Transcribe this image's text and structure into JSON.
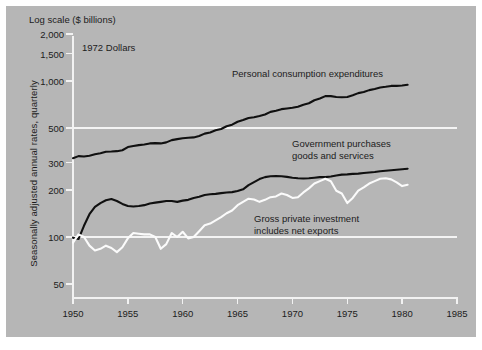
{
  "figure": {
    "background_color": "#b6b6b6",
    "header_label": "Log scale ($ billions)",
    "dollars_note": "1972 Dollars",
    "ylabel": "Seasonally adjusted annual rates, quarterly"
  },
  "chart_data": {
    "type": "line",
    "title": "",
    "subtitle": "1972 Dollars",
    "xlabel": "",
    "ylabel": "Seasonally adjusted annual rates, quarterly",
    "axis_note": "Log scale ($ billions)",
    "yscale": "log",
    "ylim": [
      40,
      2400
    ],
    "xlim": [
      1950,
      1985
    ],
    "yticks": [
      2000,
      1500,
      1000,
      500,
      300,
      200,
      100,
      50
    ],
    "ytick_labels": [
      "2,000",
      "1,500",
      "1,000",
      "500",
      "300",
      "200",
      "100",
      "50"
    ],
    "xticks": [
      1950,
      1955,
      1960,
      1965,
      1970,
      1975,
      1980,
      1985
    ],
    "xtick_labels": [
      "1950",
      "1955",
      "1960",
      "1965",
      "1970",
      "1975",
      "1980",
      "1985"
    ],
    "gridlines_y": [
      500,
      100
    ],
    "grid": "horizontal-only",
    "legend": "inline-annotations",
    "series": [
      {
        "name": "Personal consumption expenditures",
        "color": "#101010",
        "label_position": "upper-middle",
        "x": [
          1950,
          1950.5,
          1951,
          1951.5,
          1952,
          1952.5,
          1953,
          1953.5,
          1954,
          1954.5,
          1955,
          1955.5,
          1956,
          1956.5,
          1957,
          1957.5,
          1958,
          1958.5,
          1959,
          1959.5,
          1960,
          1960.5,
          1961,
          1961.5,
          1962,
          1962.5,
          1963,
          1963.5,
          1964,
          1964.5,
          1965,
          1965.5,
          1966,
          1966.5,
          1967,
          1967.5,
          1968,
          1968.5,
          1969,
          1969.5,
          1970,
          1970.5,
          1971,
          1971.5,
          1972,
          1972.5,
          1973,
          1973.5,
          1974,
          1974.5,
          1975,
          1975.5,
          1976,
          1976.5,
          1977,
          1977.5,
          1978,
          1978.5,
          1979,
          1979.5,
          1980,
          1980.5
        ],
        "values": [
          320,
          330,
          328,
          332,
          339,
          344,
          352,
          353,
          355,
          360,
          377,
          383,
          388,
          392,
          398,
          400,
          398,
          404,
          418,
          424,
          430,
          433,
          435,
          444,
          460,
          468,
          483,
          492,
          513,
          525,
          548,
          562,
          579,
          586,
          597,
          610,
          634,
          645,
          660,
          666,
          673,
          684,
          705,
          720,
          753,
          772,
          800,
          800,
          790,
          786,
          790,
          810,
          836,
          849,
          874,
          889,
          908,
          918,
          930,
          930,
          935,
          945
        ]
      },
      {
        "name": "Government purchases goods and services",
        "color": "#101010",
        "label_position": "middle-right",
        "x": [
          1950,
          1950.5,
          1951,
          1951.5,
          1952,
          1952.5,
          1953,
          1953.5,
          1954,
          1954.5,
          1955,
          1955.5,
          1956,
          1956.5,
          1957,
          1957.5,
          1958,
          1958.5,
          1959,
          1959.5,
          1960,
          1960.5,
          1961,
          1961.5,
          1962,
          1962.5,
          1963,
          1963.5,
          1964,
          1964.5,
          1965,
          1965.5,
          1966,
          1966.5,
          1967,
          1967.5,
          1968,
          1968.5,
          1969,
          1969.5,
          1970,
          1970.5,
          1971,
          1971.5,
          1972,
          1972.5,
          1973,
          1973.5,
          1974,
          1974.5,
          1975,
          1975.5,
          1976,
          1976.5,
          1977,
          1977.5,
          1978,
          1978.5,
          1979,
          1979.5,
          1980,
          1980.5
        ],
        "values": [
          99,
          97,
          118,
          140,
          156,
          165,
          172,
          175,
          170,
          163,
          158,
          157,
          158,
          160,
          164,
          166,
          168,
          170,
          170,
          168,
          171,
          173,
          178,
          181,
          186,
          188,
          189,
          191,
          193,
          194,
          197,
          202,
          215,
          225,
          235,
          242,
          245,
          246,
          245,
          243,
          240,
          238,
          237,
          238,
          240,
          242,
          242,
          244,
          248,
          251,
          252,
          254,
          255,
          257,
          259,
          261,
          264,
          266,
          268,
          270,
          272,
          274
        ]
      },
      {
        "name": "Gross private investment includes net exports",
        "color": "#fbfbfb",
        "label_position": "lower-middle",
        "x": [
          1950,
          1950.5,
          1951,
          1951.5,
          1952,
          1952.5,
          1953,
          1953.5,
          1954,
          1954.5,
          1955,
          1955.5,
          1956,
          1956.5,
          1957,
          1957.5,
          1958,
          1958.5,
          1959,
          1959.5,
          1960,
          1960.5,
          1961,
          1961.5,
          1962,
          1962.5,
          1963,
          1963.5,
          1964,
          1964.5,
          1965,
          1965.5,
          1966,
          1966.5,
          1967,
          1967.5,
          1968,
          1968.5,
          1969,
          1969.5,
          1970,
          1970.5,
          1971,
          1971.5,
          1972,
          1972.5,
          1973,
          1973.5,
          1974,
          1974.5,
          1975,
          1975.5,
          1976,
          1976.5,
          1977,
          1977.5,
          1978,
          1978.5,
          1979,
          1979.5,
          1980,
          1980.5
        ],
        "values": [
          92,
          104,
          100,
          88,
          82,
          84,
          88,
          85,
          80,
          86,
          98,
          106,
          105,
          104,
          104,
          100,
          84,
          90,
          106,
          100,
          108,
          98,
          100,
          109,
          119,
          122,
          128,
          134,
          142,
          148,
          160,
          168,
          176,
          174,
          168,
          173,
          180,
          182,
          190,
          186,
          178,
          180,
          193,
          205,
          220,
          228,
          236,
          228,
          198,
          190,
          165,
          178,
          198,
          208,
          220,
          228,
          236,
          238,
          234,
          224,
          212,
          216
        ]
      }
    ]
  }
}
